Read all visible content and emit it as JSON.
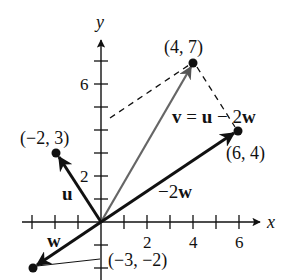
{
  "axes": {
    "x_label": "x",
    "y_label": "y",
    "x_ticks": [
      {
        "value": 2,
        "label": "2"
      },
      {
        "value": 4,
        "label": "4"
      },
      {
        "value": 6,
        "label": "6"
      }
    ],
    "y_ticks": [
      {
        "value": 2,
        "label": "2"
      },
      {
        "value": 6,
        "label": "6"
      }
    ],
    "x_range": [
      -4,
      7
    ],
    "y_range": [
      -3,
      8
    ]
  },
  "points": [
    {
      "id": "v",
      "coords": [
        4,
        7
      ],
      "label": "(4, 7)"
    },
    {
      "id": "u",
      "coords": [
        -2,
        3
      ],
      "label": "(−2, 3)"
    },
    {
      "id": "neg2w",
      "coords": [
        6,
        4
      ],
      "label": "(6, 4)"
    },
    {
      "id": "w",
      "coords": [
        -3,
        -2
      ],
      "label": "(−3, −2)"
    }
  ],
  "vectors": [
    {
      "id": "u",
      "from": [
        0,
        0
      ],
      "to": [
        -2,
        3
      ],
      "label": "u",
      "style": "bold"
    },
    {
      "id": "w",
      "from": [
        0,
        0
      ],
      "to": [
        -3,
        -2
      ],
      "label": "w",
      "style": "bold"
    },
    {
      "id": "neg2w",
      "from": [
        0,
        0
      ],
      "to": [
        6,
        4
      ],
      "label_prefix": "−2",
      "label_bold": "w",
      "style": "bold"
    },
    {
      "id": "v",
      "from": [
        0,
        0
      ],
      "to": [
        4,
        7
      ],
      "label": "",
      "style": "gray"
    }
  ],
  "equation": {
    "v": "v",
    "eq": " = ",
    "u": "u",
    "minus": " − 2",
    "w": "w"
  },
  "colors": {
    "ink": "#111111",
    "v_vector": "#777777",
    "background": "#ffffff"
  }
}
